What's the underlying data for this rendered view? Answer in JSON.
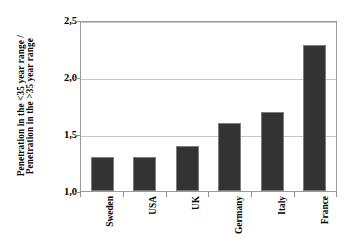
{
  "chart_data": {
    "type": "bar",
    "title": "",
    "xlabel": "",
    "ylabel": "Penetration in the <35 year range / Penetration in the >35 year range",
    "ylabel_lines": [
      "Penetration in the <35 year range /",
      "Penetration in the >35 year range"
    ],
    "categories": [
      "Sweden",
      "USA",
      "UK",
      "Germany",
      "Italy",
      "France"
    ],
    "values": [
      1.3,
      1.3,
      1.4,
      1.6,
      1.7,
      2.3
    ],
    "ylim": [
      1.0,
      2.5
    ],
    "ytick_values": [
      1.0,
      1.5,
      2.0,
      2.5
    ],
    "ytick_labels": [
      "1,0",
      "1,5",
      "2,0",
      "2,5"
    ],
    "grid": true,
    "legend": false,
    "decimal_separator": ",",
    "bar_color": "#333333",
    "gridline_color": "#c6c6c6",
    "frame_color": "#9a9a9a",
    "background_color": "#ffffff"
  }
}
